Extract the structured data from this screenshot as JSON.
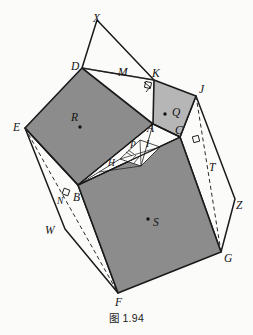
{
  "figure": {
    "caption": "图 1.94",
    "colors": {
      "stroke": "#1a1a1a",
      "dark_fill": "#8c8c8c",
      "light_fill": "#b6b6b6",
      "white_fill": "#fbfbfa",
      "background": "#fbfbfa",
      "dash": "#2a2a2a"
    },
    "vertex_labels": [
      {
        "name": "X",
        "text": "X",
        "x": 93,
        "y": 22
      },
      {
        "name": "D",
        "text": "D",
        "x": 71,
        "y": 70
      },
      {
        "name": "M",
        "text": "M",
        "x": 118,
        "y": 76
      },
      {
        "name": "K",
        "text": "K",
        "x": 152,
        "y": 77
      },
      {
        "name": "J",
        "text": "J",
        "x": 199,
        "y": 93
      },
      {
        "name": "E",
        "text": "E",
        "x": 13,
        "y": 131
      },
      {
        "name": "R",
        "text": "R",
        "x": 71,
        "y": 121
      },
      {
        "name": "Q",
        "text": "Q",
        "x": 172,
        "y": 116
      },
      {
        "name": "A",
        "text": "A",
        "x": 147,
        "y": 132
      },
      {
        "name": "C",
        "text": "C",
        "x": 175,
        "y": 134
      },
      {
        "name": "P",
        "text": "P",
        "x": 130,
        "y": 148
      },
      {
        "name": "I",
        "text": "I",
        "x": 146,
        "y": 147
      },
      {
        "name": "H",
        "text": "H",
        "x": 108,
        "y": 166
      },
      {
        "name": "T",
        "text": "T",
        "x": 209,
        "y": 171
      },
      {
        "name": "N",
        "text": "N",
        "x": 57,
        "y": 204
      },
      {
        "name": "B",
        "text": "B",
        "x": 73,
        "y": 201
      },
      {
        "name": "Z",
        "text": "Z",
        "x": 236,
        "y": 209
      },
      {
        "name": "W",
        "text": "W",
        "x": 45,
        "y": 234
      },
      {
        "name": "S",
        "text": "S",
        "x": 153,
        "y": 226
      },
      {
        "name": "G",
        "text": "G",
        "x": 224,
        "y": 262
      },
      {
        "name": "F",
        "text": "F",
        "x": 115,
        "y": 306
      }
    ],
    "points": {
      "X": [
        97,
        20
      ],
      "D": [
        82,
        68
      ],
      "K": [
        154,
        80
      ],
      "J": [
        196,
        96
      ],
      "A": [
        153,
        124
      ],
      "C": [
        180,
        137
      ],
      "E": [
        25,
        128
      ],
      "B": [
        78,
        185
      ],
      "F": [
        118,
        293
      ],
      "G": [
        221,
        252
      ],
      "Wtip": [
        65,
        229
      ],
      "Ztip": [
        235,
        199
      ],
      "P": [
        130,
        152
      ],
      "I": [
        141,
        152
      ],
      "H": [
        111,
        162
      ],
      "Hend": [
        99,
        169
      ]
    },
    "centroid_dots": [
      {
        "name": "R",
        "x": 80,
        "y": 127
      },
      {
        "name": "Q",
        "x": 165,
        "y": 114
      },
      {
        "name": "S",
        "x": 148,
        "y": 219
      }
    ],
    "shapes": [
      {
        "name": "square-EDAB",
        "fill": "dark",
        "label": "R"
      },
      {
        "name": "square-AKJC",
        "fill": "light",
        "label": "Q"
      },
      {
        "name": "square-BCGF",
        "fill": "dark",
        "label": "S"
      },
      {
        "name": "triangle-XDK",
        "fill": "white"
      },
      {
        "name": "flap-EWBF",
        "fill": "white"
      },
      {
        "name": "flap-CJZG",
        "fill": "white"
      },
      {
        "name": "inner-fan-ABC",
        "fill": "white"
      }
    ],
    "right_angle_marks": [
      {
        "name": "right-angle-at-K",
        "x": 148,
        "y": 85
      },
      {
        "name": "right-angle-at-C",
        "x": 196,
        "y": 139
      },
      {
        "name": "right-angle-at-N",
        "x": 66,
        "y": 192
      }
    ],
    "dashed_segments": [
      {
        "name": "dash-D-K",
        "from": "D",
        "to": "K"
      },
      {
        "name": "dash-E-F",
        "from": "E",
        "to": "F"
      },
      {
        "name": "dash-J-G",
        "from": "J",
        "to": "G"
      }
    ]
  }
}
